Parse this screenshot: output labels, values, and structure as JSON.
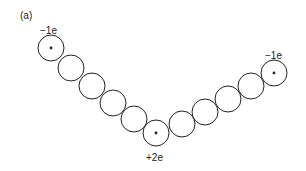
{
  "panel_label": "(a)",
  "charges": {
    "left": "−1e",
    "center": "+2e",
    "right": "−1e"
  },
  "colors": {
    "stroke": "#222222",
    "background": "#ffffff"
  },
  "beads": [
    {
      "cx": 51,
      "cy": 48,
      "charged": true
    },
    {
      "cx": 71,
      "cy": 68,
      "charged": false
    },
    {
      "cx": 92,
      "cy": 86,
      "charged": false
    },
    {
      "cx": 113,
      "cy": 103,
      "charged": false
    },
    {
      "cx": 134,
      "cy": 119,
      "charged": false
    },
    {
      "cx": 156,
      "cy": 133,
      "charged": true
    },
    {
      "cx": 182,
      "cy": 124,
      "charged": false
    },
    {
      "cx": 205,
      "cy": 112,
      "charged": false
    },
    {
      "cx": 228,
      "cy": 99,
      "charged": false
    },
    {
      "cx": 251,
      "cy": 86,
      "charged": false
    },
    {
      "cx": 274,
      "cy": 73,
      "charged": true
    }
  ],
  "bead_radius": 13
}
